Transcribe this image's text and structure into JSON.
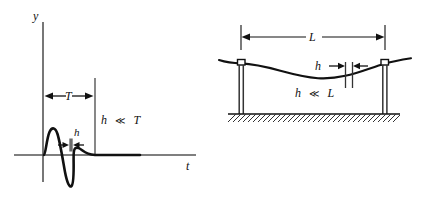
{
  "figure": {
    "panels": [
      {
        "id": "left",
        "name": "pulse-waveform-panel",
        "axes": {
          "y_axis_label": "y",
          "t_axis_label": "t"
        },
        "labels": {
          "period": "T",
          "pulse_width": "h",
          "inequality_symbol": "≪",
          "inequality_lhs": "h",
          "inequality_rhs": "T",
          "inequality_full": "h ≪ T"
        }
      },
      {
        "id": "right",
        "name": "suspension-cable-panel",
        "labels": {
          "span": "L",
          "sag": "h",
          "inequality_symbol": "≪",
          "inequality_lhs": "h",
          "inequality_rhs": "L",
          "inequality_full": "h ≪ L"
        }
      }
    ]
  },
  "colors": {
    "ink": "#111111",
    "line": "#1a1a1a",
    "thin": "#555555",
    "ground_hatch": "#333333",
    "background": "#ffffff"
  }
}
